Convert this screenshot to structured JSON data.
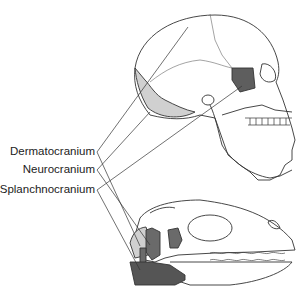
{
  "labels": {
    "dermatocranium": "Dermatocranium",
    "neurocranium": "Neurocranium",
    "splanchnocranium": "Splanchnocranium"
  },
  "colors": {
    "outline": "#333333",
    "dermatocranium_fill": "#d0d0d0",
    "neurocranium_fill": "#6a6a6a",
    "splanchnocranium_fill": "#555555",
    "background": "#ffffff"
  },
  "figures": {
    "top": "human skull, lateral view",
    "bottom": "reptile skull, lateral view"
  }
}
